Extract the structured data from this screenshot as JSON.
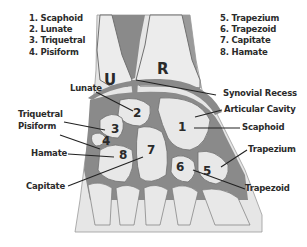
{
  "legend_left": [
    {
      "n": "1",
      "name": "Scaphoid",
      "text": "1. Scaphoid"
    },
    {
      "n": "2",
      "name": "Lunate",
      "text": "2. Lunate"
    },
    {
      "n": "3",
      "name": "Triquetral",
      "text": "3. Triquetral"
    },
    {
      "n": "4",
      "name": "Pisiform",
      "text": "4. Pisiform"
    }
  ],
  "legend_right": [
    {
      "n": "5",
      "name": "Trapezium",
      "text": "5. Trapezium"
    },
    {
      "n": "6",
      "name": "Trapezoid",
      "text": "6. Trapezoid"
    },
    {
      "n": "7",
      "name": "Capitate",
      "text": "7. Capitate"
    },
    {
      "n": "8",
      "name": "Hamate",
      "text": "8. Hamate"
    }
  ],
  "forearm_bones": {
    "ulna": "U",
    "radius": "R"
  },
  "callouts_left": {
    "lunate": "Lunate",
    "triquetral": "Triquetral",
    "pisiform": "Pisiform",
    "hamate": "Hamate",
    "capitate": "Capitate"
  },
  "callouts_right": {
    "synovial_recess": "Synovial Recess",
    "articular_cavity": "Articular Cavity",
    "scaphoid": "Scaphoid",
    "trapezium": "Trapezium",
    "trapezoid": "Trapezoid"
  },
  "bone_numbers": {
    "n1": "1",
    "n2": "2",
    "n3": "3",
    "n4": "4",
    "n5": "5",
    "n6": "6",
    "n7": "7",
    "n8": "8"
  },
  "colors": {
    "bone": "#e6e6e6",
    "cartilage": "#8a8a8a",
    "outline": "#6e6e6e",
    "text": "#2b2b2b",
    "background": "#ffffff"
  }
}
